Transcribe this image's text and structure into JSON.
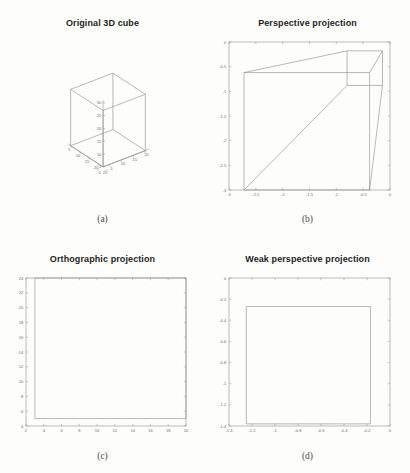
{
  "figure": {
    "background": "#fdfdfb",
    "line_color": "#8a8a8a",
    "axis_color": "#909090",
    "tick_color": "#6e6e6e",
    "title_color": "#1d1d1d"
  },
  "panels": [
    {
      "key": "original_3d_cube",
      "title": "Original 3D cube",
      "caption": "(a)"
    },
    {
      "key": "perspective_projection",
      "title": "Perspective projection",
      "caption": "(b)"
    },
    {
      "key": "orthographic_projection",
      "title": "Orthographic projection",
      "caption": "(c)"
    },
    {
      "key": "weak_perspective_projection",
      "title": "Weak perspective projection",
      "caption": "(d)"
    }
  ],
  "chart_data": [
    {
      "type": "line",
      "id": "original_3d_cube",
      "title": "Original 3D cube",
      "caption": "(a)",
      "projection": "3d",
      "xlabel": "",
      "ylabel": "",
      "zlabel": "",
      "grid": false,
      "xlim": [
        0,
        20
      ],
      "ylim": [
        5,
        25
      ],
      "zlim": [
        5,
        30
      ],
      "xticks": [
        0,
        5,
        10,
        15,
        20
      ],
      "xticklabels": [
        "0",
        "5",
        "10",
        "15",
        "20"
      ],
      "yticks": [
        5,
        10,
        15,
        20,
        25
      ],
      "yticklabels": [
        "5",
        "10",
        "15",
        "20",
        "25"
      ],
      "zticks": [
        5,
        10,
        15,
        20,
        25,
        30
      ],
      "zticklabels": [
        "5",
        "10",
        "15",
        "20",
        "25",
        "30"
      ],
      "description": "Wireframe cube drawn with 12 edges in default MATLAB 3-D view",
      "cube_vertices_3d": [
        [
          2,
          5,
          5
        ],
        [
          20,
          5,
          5
        ],
        [
          20,
          23,
          5
        ],
        [
          2,
          23,
          5
        ],
        [
          2,
          5,
          27
        ],
        [
          20,
          5,
          27
        ],
        [
          20,
          23,
          27
        ],
        [
          2,
          23,
          27
        ]
      ],
      "cube_edges": [
        [
          0,
          1
        ],
        [
          1,
          2
        ],
        [
          2,
          3
        ],
        [
          3,
          0
        ],
        [
          4,
          5
        ],
        [
          5,
          6
        ],
        [
          6,
          7
        ],
        [
          7,
          4
        ],
        [
          0,
          4
        ],
        [
          1,
          5
        ],
        [
          2,
          6
        ],
        [
          3,
          7
        ]
      ]
    },
    {
      "type": "line",
      "id": "perspective_projection",
      "title": "Perspective projection",
      "caption": "(b)",
      "projection": "2d",
      "xlabel": "",
      "ylabel": "",
      "grid": false,
      "xlim": [
        -3,
        0
      ],
      "ylim": [
        -3,
        0
      ],
      "xticks": [
        -3,
        -2.5,
        -2,
        -1.5,
        -1,
        -0.5,
        0
      ],
      "xticklabels": [
        "-3",
        "-2.5",
        "-2",
        "-1.5",
        "-1",
        "-0.5",
        "0"
      ],
      "yticks": [
        -3,
        -2.5,
        -2,
        -1.5,
        -1,
        -0.5,
        0
      ],
      "yticklabels": [
        "-3",
        "-2.5",
        "-2",
        "-1.5",
        "-1",
        "-0.5",
        "0"
      ],
      "description": "Projected cube: near face large at left, far face small at upper right, connected by perspective edges",
      "near_face": [
        [
          -2.72,
          -0.62
        ],
        [
          -2.72,
          -3.0
        ],
        [
          -0.38,
          -3.0
        ],
        [
          -0.38,
          -0.62
        ]
      ],
      "far_face": [
        [
          -0.8,
          -0.18
        ],
        [
          -0.8,
          -0.88
        ],
        [
          -0.14,
          -0.88
        ],
        [
          -0.14,
          -0.18
        ]
      ],
      "connector_edges": [
        [
          [
            -2.72,
            -0.62
          ],
          [
            -0.8,
            -0.18
          ]
        ],
        [
          [
            -2.72,
            -3.0
          ],
          [
            -0.8,
            -0.88
          ]
        ],
        [
          [
            -0.38,
            -3.0
          ],
          [
            -0.14,
            -0.88
          ]
        ],
        [
          [
            -0.38,
            -0.62
          ],
          [
            -0.14,
            -0.18
          ]
        ]
      ]
    },
    {
      "type": "line",
      "id": "orthographic_projection",
      "title": "Orthographic projection",
      "caption": "(c)",
      "projection": "2d",
      "xlabel": "",
      "ylabel": "",
      "grid": false,
      "xlim": [
        2,
        20
      ],
      "ylim": [
        4,
        24
      ],
      "xticks": [
        2,
        4,
        6,
        8,
        10,
        12,
        14,
        16,
        18,
        20
      ],
      "xticklabels": [
        "2",
        "4",
        "6",
        "8",
        "10",
        "12",
        "14",
        "16",
        "18",
        "20"
      ],
      "yticks": [
        4,
        6,
        8,
        10,
        12,
        14,
        16,
        18,
        20,
        22,
        24
      ],
      "yticklabels": [
        "4",
        "6",
        "8",
        "10",
        "12",
        "14",
        "16",
        "18",
        "20",
        "22",
        "24"
      ],
      "description": "Orthographic projection collapses the cube onto a single square whose edges coincide with the axes box",
      "square": [
        [
          3.0,
          5.0
        ],
        [
          20.0,
          5.0
        ],
        [
          20.0,
          24.0
        ],
        [
          3.0,
          24.0
        ]
      ]
    },
    {
      "type": "line",
      "id": "weak_perspective_projection",
      "title": "Weak perspective projection",
      "caption": "(d)",
      "projection": "2d",
      "xlabel": "",
      "ylabel": "",
      "grid": false,
      "xlim": [
        -1.4,
        0
      ],
      "ylim": [
        -1.4,
        0
      ],
      "xticks": [
        -1.4,
        -1.2,
        -1,
        -0.8,
        -0.6,
        -0.4,
        -0.2,
        0
      ],
      "xticklabels": [
        "-1.4",
        "-1.2",
        "-1",
        "-0.8",
        "-0.6",
        "-0.4",
        "-0.2",
        "0"
      ],
      "yticks": [
        -1.4,
        -1.2,
        -1,
        -0.8,
        -0.6,
        -0.4,
        -0.2,
        0
      ],
      "yticklabels": [
        "-1.4",
        "-1.2",
        "-1",
        "-0.8",
        "-0.6",
        "-0.4",
        "-0.2",
        "0"
      ],
      "description": "Weak perspective projection yields a single scaled square",
      "square": [
        [
          -1.25,
          -0.27
        ],
        [
          -0.17,
          -0.27
        ],
        [
          -0.17,
          -1.38
        ],
        [
          -1.25,
          -1.38
        ]
      ]
    }
  ]
}
